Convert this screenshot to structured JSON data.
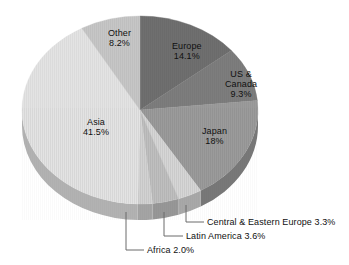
{
  "chart": {
    "type": "pie",
    "title": "",
    "center": {
      "x": 140,
      "y": 110
    },
    "radius": {
      "rx": 118,
      "ry": 94
    },
    "depth": 16
  },
  "chart_data": {
    "type": "pie",
    "title": "",
    "subtitle": "",
    "xlabel": "",
    "ylabel": "",
    "units": "percent",
    "total": 100,
    "legend_position": "none",
    "grid": false,
    "labels_inside": [
      "Other",
      "Europe",
      "US & Canada",
      "Japan",
      "Asia"
    ],
    "labels_callout": [
      "Central & Eastern Europe",
      "Latin America",
      "Africa"
    ],
    "categories": [
      "Europe",
      "US & Canada",
      "Japan",
      "Central & Eastern Europe",
      "Latin America",
      "Africa",
      "Asia",
      "Other"
    ],
    "values": [
      14.1,
      9.3,
      18.0,
      3.3,
      3.6,
      2.0,
      41.5,
      8.2
    ],
    "value_labels": [
      "14.1%",
      "9.3%",
      "18%",
      "3.3%",
      "3.6%",
      "2.0%",
      "41.5%",
      "8.2%"
    ],
    "slices": [
      {
        "name": "Europe",
        "value": 14.1,
        "value_label": "14.1%",
        "color": "#6f6f6f",
        "side_color": "#555555",
        "start_angle": 0,
        "end_angle": 50.76,
        "label_placement": "inside"
      },
      {
        "name": "US & Canada",
        "value": 9.3,
        "value_label": "9.3%",
        "color": "#7d7d7d",
        "side_color": "#606060",
        "start_angle": 50.76,
        "end_angle": 84.24,
        "label_placement": "inside"
      },
      {
        "name": "Japan",
        "value": 18.0,
        "value_label": "18%",
        "color": "#9b9b9b",
        "side_color": "#787878",
        "start_angle": 84.24,
        "end_angle": 149.04,
        "label_placement": "inside"
      },
      {
        "name": "Central & Eastern Europe",
        "value": 3.3,
        "value_label": "3.3%",
        "color": "#d6d6d6",
        "side_color": "#a8a8a8",
        "start_angle": 149.04,
        "end_angle": 160.92,
        "label_placement": "callout"
      },
      {
        "name": "Latin America",
        "value": 3.6,
        "value_label": "3.6%",
        "color": "#bfbfbf",
        "side_color": "#979797",
        "start_angle": 160.92,
        "end_angle": 173.88,
        "label_placement": "callout"
      },
      {
        "name": "Africa",
        "value": 2.0,
        "value_label": "2.0%",
        "color": "#d2d2d2",
        "side_color": "#a4a4a4",
        "start_angle": 173.88,
        "end_angle": 181.08,
        "label_placement": "callout"
      },
      {
        "name": "Asia",
        "value": 41.5,
        "value_label": "41.5%",
        "color": "#e3e3e3",
        "side_color": "#b2b2b2",
        "start_angle": 181.08,
        "end_angle": 330.48,
        "label_placement": "inside"
      },
      {
        "name": "Other",
        "value": 8.2,
        "value_label": "8.2%",
        "color": "#c6c6c6",
        "side_color": "#9c9c9c",
        "start_angle": 330.48,
        "end_angle": 360,
        "label_placement": "inside"
      }
    ]
  },
  "inside_labels": [
    {
      "name": "Other",
      "value_label": "8.2%",
      "x": 108,
      "y": 28
    },
    {
      "name": "Europe",
      "value_label": "14.1%",
      "x": 172,
      "y": 41
    },
    {
      "name": "US &",
      "name2": "Canada",
      "value_label": "9.3%",
      "x": 225,
      "y": 69
    },
    {
      "name": "Japan",
      "value_label": "18%",
      "x": 202,
      "y": 126
    },
    {
      "name": "Asia",
      "value_label": "41.5%",
      "x": 83,
      "y": 117
    }
  ],
  "callouts": [
    {
      "name": "Central & Eastern Europe",
      "value_label": "3.3%",
      "text": "Central & Eastern Europe 3.3%",
      "text_x": 207,
      "text_y": 218,
      "elbow_x": 186,
      "elbow_y": 222,
      "anchor_x": 186,
      "anchor_y": 205,
      "line_end_x": 204,
      "line_end_y": 222
    },
    {
      "name": "Latin America",
      "value_label": "3.6%",
      "text": "Latin America 3.6%",
      "text_x": 186,
      "text_y": 232,
      "elbow_x": 164,
      "elbow_y": 236,
      "anchor_x": 164,
      "anchor_y": 212,
      "line_end_x": 183,
      "line_end_y": 236
    },
    {
      "name": "Africa",
      "value_label": "2.0%",
      "text": "Africa 2.0%",
      "text_x": 147,
      "text_y": 246,
      "elbow_x": 126,
      "elbow_y": 250,
      "anchor_x": 126,
      "anchor_y": 212,
      "line_end_x": 144,
      "line_end_y": 250
    }
  ],
  "colors": {
    "background": "#ffffff",
    "text": "#101010",
    "leader_line": "#6b6b6b",
    "outline": "#8a8a8a"
  }
}
